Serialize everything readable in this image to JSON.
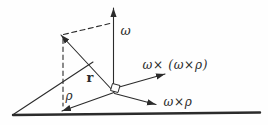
{
  "figure": {
    "colors": {
      "line": "#2b2b2b",
      "background": "#fefefe"
    },
    "labels": {
      "omega": "ω",
      "omega_cross_omega_cross_rho": "ω× (ω×ρ)",
      "omega_cross_rho": "ω×ρ",
      "position_vector": "r",
      "rho": "ρ"
    }
  }
}
